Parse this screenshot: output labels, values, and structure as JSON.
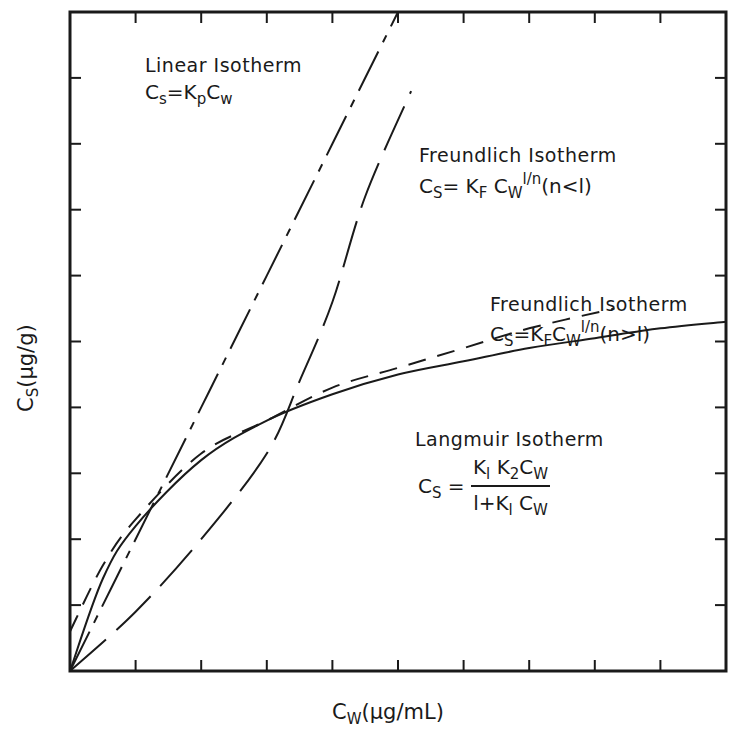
{
  "chart_data": {
    "type": "line",
    "title": "",
    "xlabel": "Cw (µg/mL)",
    "ylabel": "Cs (µg/g)",
    "xlim": [
      0,
      10
    ],
    "ylim": [
      0,
      10
    ],
    "x_ticks": 10,
    "y_ticks": 10,
    "tick_labels": "none (unlabeled tick marks)",
    "grid": false,
    "legend": "inline annotations",
    "series": [
      {
        "name": "Linear Isotherm",
        "equation": "Cs=KpCw",
        "style": "dash-dot",
        "x": [
          0,
          1,
          2,
          3,
          4,
          5
        ],
        "y": [
          0,
          2.0,
          4.0,
          6.0,
          8.0,
          10.0
        ]
      },
      {
        "name": "Freundlich Isotherm (n<1)",
        "equation": "Cs=KF Cw^(1/n) (n<1)",
        "style": "long-dash",
        "x": [
          0,
          1,
          2,
          3,
          3.5,
          4,
          4.5,
          5.2
        ],
        "y": [
          0,
          0.9,
          2.0,
          3.3,
          4.4,
          5.6,
          7.2,
          8.8
        ]
      },
      {
        "name": "Freundlich Isotherm (n>1)",
        "equation": "Cs=KF Cw^(1/n) (n>1)",
        "style": "dashed",
        "x": [
          0,
          0.5,
          1,
          2,
          3,
          4,
          5,
          6,
          7,
          8.3
        ],
        "y": [
          0.6,
          1.6,
          2.3,
          3.3,
          3.8,
          4.3,
          4.6,
          4.9,
          5.2,
          5.5
        ]
      },
      {
        "name": "Langmuir Isotherm",
        "equation": "Cs = K1K2Cw / (1+K1Cw)",
        "style": "solid",
        "x": [
          0,
          0.5,
          1,
          2,
          3,
          4,
          5,
          6,
          7,
          8,
          9,
          10
        ],
        "y": [
          0,
          1.4,
          2.2,
          3.2,
          3.8,
          4.2,
          4.5,
          4.7,
          4.9,
          5.05,
          5.2,
          5.3
        ]
      }
    ],
    "annotations": [
      {
        "title": "Linear Isotherm",
        "equation": "Cs=KpCw"
      },
      {
        "title": "Freundlich Isotherm",
        "equation": "Cs=KF Cw1/n(n<1)"
      },
      {
        "title": "Freundlich Isotherm",
        "equation": "Cs=KFCw1/n(n>1)"
      },
      {
        "title": "Langmuir Isotherm",
        "equation": "Cs = K1K2Cw / 1+K1Cw"
      }
    ]
  },
  "labels": {
    "linear": {
      "title": "Linear Isotherm",
      "lhs": "C",
      "lhs_sub": "s",
      "eq_mid": "=K",
      "k_sub": "p",
      "rhs": "C",
      "rhs_sub": "w"
    },
    "fr_lt": {
      "title": "Freundlich Isotherm",
      "lhs": "C",
      "lhs_sub": "S",
      "eq_mid": "= K",
      "k_sub": "F",
      "rhs": " C",
      "rhs_sub": "W",
      "exp": "l/n",
      "cond": "(n<l)"
    },
    "fr_gt": {
      "title": "Freundlich Isotherm",
      "lhs": "C",
      "lhs_sub": "S",
      "eq_mid": "=K",
      "k_sub": "F",
      "rhs": "C",
      "rhs_sub": "W",
      "exp": "l/n",
      "cond": "(n>l)"
    },
    "langmuir": {
      "title": "Langmuir Isotherm",
      "lhs": "C",
      "lhs_sub": "S",
      "eq": " =",
      "num_k1": "K",
      "num_k1_sub": "l",
      "num_k2": " K",
      "num_k2_sub": "2",
      "num_c": "C",
      "num_c_sub": "W",
      "den_one": "l+K",
      "den_k_sub": "l",
      "den_c": " C",
      "den_c_sub": "W"
    }
  },
  "axes": {
    "x_title": "C",
    "x_title_sub": "W",
    "x_title_rest": "(µg/mL)",
    "y_title": "C",
    "y_title_sub": "S",
    "y_title_rest": "(µg/g)"
  }
}
